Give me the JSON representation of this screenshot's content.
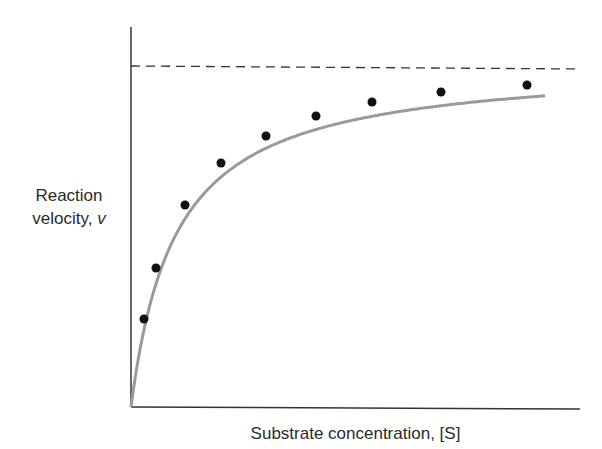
{
  "chart_data": {
    "type": "scatter",
    "title": "",
    "xlabel": "Substrate concentration, [S]",
    "ylabel": "Reaction velocity, v",
    "ylabel_line1": "Reaction",
    "ylabel_line2": "velocity,",
    "ylabel_var": "v",
    "grid": false,
    "legend": "none",
    "asymptote": {
      "label": "Vmax",
      "y_px": 66,
      "style": "dashed"
    },
    "series": [
      {
        "name": "Measured velocity",
        "style": "points",
        "points_px": [
          [
            144,
            319
          ],
          [
            156,
            268
          ],
          [
            185,
            205
          ],
          [
            221,
            163
          ],
          [
            266,
            136
          ],
          [
            316,
            116
          ],
          [
            372,
            102
          ],
          [
            441,
            92
          ],
          [
            527,
            85
          ]
        ]
      },
      {
        "name": "Michaelis-Menten fit",
        "style": "curve",
        "color": "#9a9a9a"
      }
    ],
    "axes": {
      "origin_px": [
        131,
        407
      ],
      "x_end_px": 580,
      "y_top_px": 27
    }
  }
}
